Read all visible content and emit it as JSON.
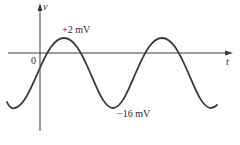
{
  "diagram": {
    "type": "waveform",
    "axes": {
      "vertical_label": "v",
      "horizontal_label": "t",
      "origin_label": "0"
    },
    "annotations": {
      "peak_label": "+2 mV",
      "trough_label": "−16 mV"
    },
    "waveform": {
      "shape": "sinusoid",
      "max_value_mV": 2,
      "min_value_mV": -16,
      "cycles_shown": 2
    },
    "colors": {
      "line": "#3a3a3a",
      "text": "#2a2a2a",
      "background": "#ffffff"
    }
  }
}
